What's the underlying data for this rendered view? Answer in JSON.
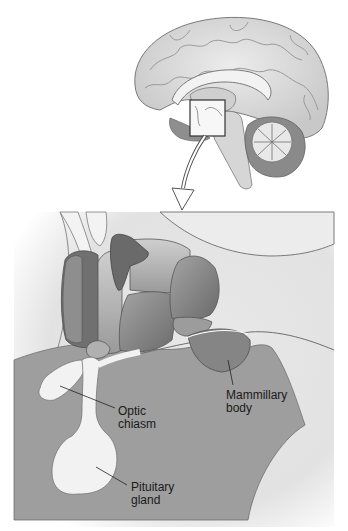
{
  "figure": {
    "overview": {
      "description": "Midsagittal view of the brain with inset box around hypothalamus region",
      "inset_box": {
        "x": 190,
        "y": 100,
        "w": 35,
        "h": 36
      }
    },
    "detail": {
      "description": "Enlarged view of hypothalamus, nuclei, optic chiasm and pituitary gland"
    },
    "labels": [
      {
        "id": "mammillary-body",
        "text": "Mammillary\nbody",
        "x": 226,
        "y": 389
      },
      {
        "id": "optic-chiasm",
        "text": "Optic\nchiasm",
        "x": 118,
        "y": 405
      },
      {
        "id": "pituitary-gland",
        "text": "Pituitary\ngland",
        "x": 131,
        "y": 481
      }
    ],
    "colors": {
      "background": "#ffffff",
      "brain_cortex": "#d9d9d9",
      "brain_outline": "#7a7a7a",
      "cerebellum": "#8a8a8a",
      "tissue_gray": "#9e9e9e",
      "nucleus_dark": "#6e6e6e",
      "nucleus_mid": "#8c8c8c",
      "light_structure": "#f0f0f0",
      "text": "#1a1a1a"
    }
  }
}
